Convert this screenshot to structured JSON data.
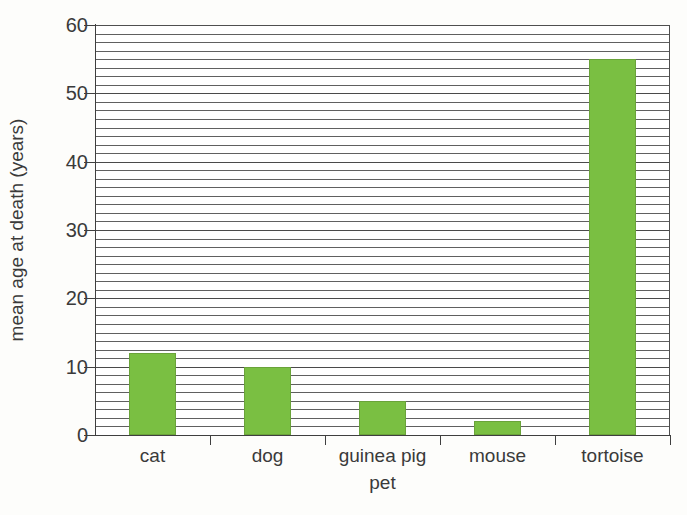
{
  "chart_data": {
    "type": "bar",
    "title": "",
    "xlabel": "pet",
    "ylabel": "mean age at death (years)",
    "categories": [
      "cat",
      "dog",
      "guinea pig",
      "mouse",
      "tortoise"
    ],
    "values": [
      12,
      10,
      5,
      2,
      55
    ],
    "series": [
      {
        "name": "mean age at death",
        "values": [
          12,
          10,
          5,
          2,
          55
        ]
      }
    ],
    "ylim": [
      0,
      60
    ],
    "ytick_labels": [
      "0",
      "10",
      "20",
      "30",
      "40",
      "50",
      "60"
    ],
    "ytick_values": [
      0,
      10,
      20,
      30,
      40,
      50,
      60
    ],
    "y_major_step": 10,
    "y_minor_step": 1.25,
    "grid": "horizontal",
    "legend": "none",
    "bar_color": "#7abf42",
    "bar_edge_color": "#6aa33a",
    "gridline_color": "#606060",
    "axis_color": "#3f3f3f",
    "text_color": "#3a3a3a",
    "background_color": "#fdfdfb",
    "plot_background_color": "#ffffff"
  }
}
